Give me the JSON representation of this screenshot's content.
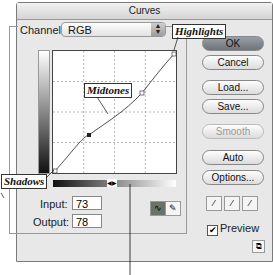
{
  "window": {
    "title": "Curves"
  },
  "channel": {
    "label": "Channel:",
    "value": "RGB"
  },
  "buttons": {
    "ok": "OK",
    "cancel": "Cancel",
    "load": "Load...",
    "save": "Save...",
    "smooth": "Smooth",
    "auto": "Auto",
    "options": "Options..."
  },
  "input": {
    "label": "Input:",
    "value": "73"
  },
  "output": {
    "label": "Output:",
    "value": "78"
  },
  "preview": {
    "label": "Preview",
    "checked": true
  },
  "callouts": {
    "highlights": "Highlights",
    "midtones": "Midtones",
    "shadows": "Shadows"
  },
  "icons": {
    "curve_tool": "curve-icon",
    "pencil_tool": "pencil-icon",
    "eyedroppers": [
      "black-eyedropper-icon",
      "gray-eyedropper-icon",
      "white-eyedropper-icon"
    ],
    "expand": "expand-icon"
  }
}
